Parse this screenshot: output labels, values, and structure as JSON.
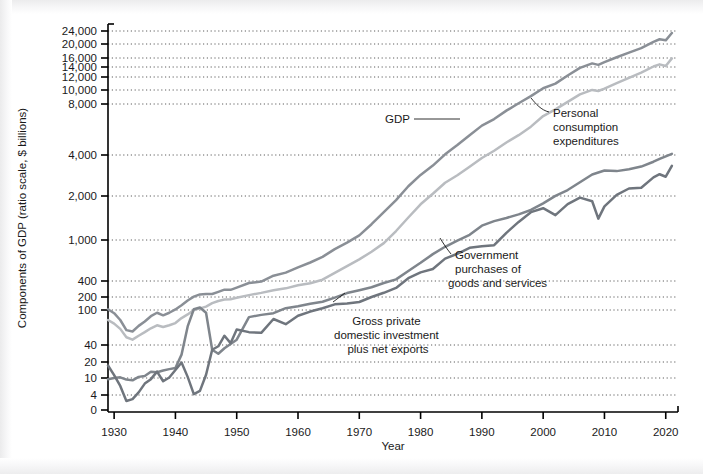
{
  "chart_data": {
    "type": "line",
    "title": "",
    "xlabel": "Year",
    "ylabel": "Components of GDP (ratio scale, $ billions)",
    "scale": "log",
    "grid": true,
    "legend_position": "inline-annotations",
    "xlim": [
      1929,
      2022
    ],
    "ylim": [
      0,
      24000
    ],
    "xticks": [
      1930,
      1940,
      1950,
      1960,
      1970,
      1980,
      1990,
      2000,
      2010,
      2020
    ],
    "xtick_labels": [
      "1930",
      "1940",
      "1950",
      "1960",
      "1970",
      "1980",
      "1990",
      "2000",
      "2010",
      "2020"
    ],
    "yticks": [
      0,
      4,
      10,
      20,
      40,
      100,
      200,
      400,
      1000,
      2000,
      4000,
      8000,
      10000,
      12000,
      14000,
      16000,
      20000,
      24000
    ],
    "ytick_labels": [
      "0",
      "4",
      "10",
      "20",
      "40",
      "100",
      "200",
      "400",
      "1,000",
      "2,000",
      "4,000",
      "8,000",
      "10,000",
      "12,000",
      "14,000",
      "16,000",
      "20,000",
      "24,000"
    ],
    "series": [
      {
        "name": "GDP",
        "color": "#8a8f96",
        "x": [
          1929,
          1930,
          1931,
          1932,
          1933,
          1934,
          1935,
          1936,
          1937,
          1938,
          1939,
          1940,
          1941,
          1942,
          1943,
          1944,
          1945,
          1946,
          1947,
          1948,
          1949,
          1950,
          1952,
          1954,
          1956,
          1958,
          1960,
          1962,
          1964,
          1966,
          1968,
          1970,
          1972,
          1974,
          1976,
          1978,
          1980,
          1982,
          1984,
          1986,
          1988,
          1990,
          1992,
          1994,
          1996,
          1998,
          2000,
          2002,
          2004,
          2006,
          2008,
          2009,
          2010,
          2012,
          2014,
          2016,
          2018,
          2019,
          2020,
          2021
        ],
        "values": [
          104,
          92,
          77,
          59,
          57,
          66,
          74,
          85,
          93,
          87,
          93,
          103,
          129,
          166,
          203,
          224,
          228,
          228,
          250,
          275,
          273,
          300,
          367,
          391,
          450,
          482,
          543,
          605,
          685,
          815,
          942,
          1076,
          1282,
          1549,
          1874,
          2357,
          2857,
          3345,
          4038,
          4580,
          5236,
          5963,
          6520,
          7309,
          8100,
          9063,
          10251,
          10936,
          12274,
          13816,
          14770,
          14450,
          15049,
          16197,
          17428,
          18707,
          20612,
          21381,
          21060,
          23315
        ]
      },
      {
        "name": "Personal consumption expenditures",
        "color": "#b9bcc0",
        "x": [
          1929,
          1930,
          1931,
          1932,
          1933,
          1934,
          1935,
          1936,
          1937,
          1938,
          1939,
          1940,
          1941,
          1942,
          1943,
          1944,
          1945,
          1946,
          1947,
          1948,
          1949,
          1950,
          1952,
          1954,
          1956,
          1958,
          1960,
          1962,
          1964,
          1966,
          1968,
          1970,
          1972,
          1974,
          1976,
          1978,
          1980,
          1982,
          1984,
          1986,
          1988,
          1990,
          1992,
          1994,
          1996,
          1998,
          2000,
          2002,
          2004,
          2006,
          2008,
          2009,
          2010,
          2012,
          2014,
          2016,
          2018,
          2019,
          2020,
          2021
        ],
        "values": [
          77,
          70,
          61,
          49,
          46,
          51,
          56,
          62,
          67,
          64,
          67,
          71,
          81,
          89,
          100,
          109,
          120,
          144,
          162,
          175,
          178,
          192,
          217,
          239,
          268,
          291,
          332,
          363,
          412,
          479,
          558,
          648,
          770,
          932,
          1152,
          1425,
          1755,
          2079,
          2500,
          2838,
          3277,
          3803,
          4236,
          4743,
          5237,
          5879,
          6792,
          7439,
          8270,
          9322,
          10012,
          9847,
          10202,
          11006,
          11863,
          12821,
          14104,
          14563,
          14212,
          15903
        ]
      },
      {
        "name": "Government purchases of goods and services",
        "color": "#7f858c",
        "x": [
          1929,
          1930,
          1931,
          1932,
          1933,
          1934,
          1935,
          1936,
          1937,
          1938,
          1939,
          1940,
          1941,
          1942,
          1943,
          1944,
          1945,
          1946,
          1947,
          1948,
          1949,
          1950,
          1952,
          1954,
          1956,
          1958,
          1960,
          1962,
          1964,
          1966,
          1968,
          1970,
          1972,
          1974,
          1976,
          1978,
          1980,
          1982,
          1984,
          1986,
          1988,
          1990,
          1992,
          1994,
          1996,
          1998,
          2000,
          2002,
          2004,
          2006,
          2008,
          2010,
          2012,
          2014,
          2016,
          2018,
          2019,
          2020,
          2021
        ],
        "values": [
          9.4,
          10.0,
          10.3,
          9.2,
          8.8,
          10.5,
          10.9,
          13.1,
          12.8,
          13.8,
          14.7,
          15.4,
          27.0,
          65.0,
          104.0,
          114.0,
          93.0,
          33.0,
          28.0,
          35.0,
          41.0,
          46.0,
          83.0,
          88.0,
          92.0,
          110.0,
          122.0,
          140.0,
          155.0,
          194.0,
          237.0,
          269.0,
          305.0,
          366.0,
          415.0,
          500.0,
          601.0,
          729.0,
          859.0,
          986.0,
          1085.0,
          1254.0,
          1347.0,
          1415.0,
          1497.0,
          1605.0,
          1780.0,
          2002.0,
          2212.0,
          2523.0,
          2878.0,
          3077.0,
          3046.0,
          3145.0,
          3288.0,
          3570.0,
          3742.0,
          3913.0,
          4062.0
        ]
      },
      {
        "name": "Gross private domestic investment plus net exports",
        "color": "#6f757d",
        "x": [
          1929,
          1930,
          1931,
          1932,
          1933,
          1934,
          1935,
          1936,
          1937,
          1938,
          1939,
          1940,
          1941,
          1942,
          1943,
          1944,
          1945,
          1946,
          1947,
          1948,
          1949,
          1950,
          1952,
          1954,
          1956,
          1958,
          1960,
          1962,
          1964,
          1966,
          1968,
          1970,
          1972,
          1974,
          1976,
          1978,
          1980,
          1982,
          1984,
          1986,
          1988,
          1990,
          1992,
          1994,
          1996,
          1998,
          2000,
          2002,
          2004,
          2006,
          2008,
          2009,
          2010,
          2012,
          2014,
          2016,
          2018,
          2019,
          2020,
          2021
        ],
        "values": [
          17.2,
          11.3,
          6.5,
          2.4,
          2.9,
          4.6,
          7.4,
          9.4,
          13.2,
          8.4,
          10.2,
          14.1,
          19.5,
          10.5,
          4.2,
          5.0,
          11.5,
          33.0,
          38.0,
          51.0,
          42.0,
          60.0,
          56.0,
          55.0,
          79.0,
          69.0,
          86.0,
          96.0,
          110.0,
          135.0,
          142.0,
          153.0,
          200.0,
          240.0,
          296.0,
          426.0,
          485.0,
          523.0,
          660.0,
          735.0,
          840.0,
          870.0,
          890.0,
          1120.0,
          1330.0,
          1550.0,
          1650.0,
          1480.0,
          1760.0,
          1950.0,
          1840.0,
          1400.0,
          1700.0,
          2040.0,
          2270.0,
          2300.0,
          2740.0,
          2890.0,
          2770.0,
          3330.0
        ]
      }
    ],
    "annotations": [
      {
        "id": "gdp",
        "label": "GDP"
      },
      {
        "id": "pce",
        "label_lines": [
          "Personal",
          "consumption",
          "expenditures"
        ]
      },
      {
        "id": "gov",
        "label_lines": [
          "Government",
          "purchases of",
          "goods and services"
        ]
      },
      {
        "id": "inv",
        "label_lines": [
          "Gross private",
          "domestic investment",
          "plus net exports"
        ]
      }
    ]
  },
  "axis": {
    "x_title": "Year",
    "y_title": "Components of GDP (ratio scale, $ billions)"
  },
  "colors": {
    "gdp": "#8a8f96",
    "pce": "#b9bcc0",
    "government": "#7f858c",
    "investment": "#6f757d",
    "axis": "#000000",
    "grid": "#4d4d4d",
    "text": "#1a1a1a"
  }
}
